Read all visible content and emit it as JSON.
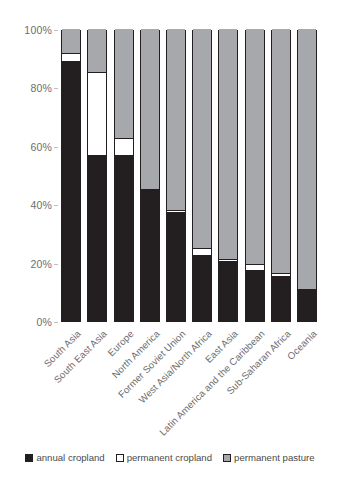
{
  "chart_data": {
    "type": "bar",
    "subtype": "stacked-100-percent",
    "title": "",
    "xlabel": "",
    "ylabel": "",
    "ylim": [
      0,
      100
    ],
    "yticks": [
      "0%",
      "20%",
      "40%",
      "60%",
      "80%",
      "100%"
    ],
    "ytick_values": [
      0,
      20,
      40,
      60,
      80,
      100
    ],
    "grid": false,
    "legend_position": "bottom",
    "categories": [
      "South Asia",
      "South East Asia",
      "Europe",
      "North America",
      "Former Soviet Union",
      "West Asia/North Africa",
      "East Asia",
      "Latin America and the Caribbean",
      "Sub-Saharan Africa",
      "Oceania"
    ],
    "series": [
      {
        "name": "annual cropland",
        "color": "#231f20",
        "values": [
          88.7,
          56.5,
          56.5,
          45.2,
          37.0,
          22.3,
          20.2,
          17.1,
          15.1,
          11.0
        ]
      },
      {
        "name": "permanent cropland",
        "color": "#ffffff",
        "values": [
          3.1,
          28.8,
          6.2,
          0.0,
          1.0,
          2.7,
          1.0,
          2.4,
          1.3,
          0.0
        ]
      },
      {
        "name": "permanent pasture",
        "color": "#a6a8ab",
        "values": [
          8.2,
          14.7,
          37.3,
          54.8,
          62.0,
          75.0,
          78.8,
          80.5,
          83.6,
          89.0
        ]
      }
    ]
  },
  "legend": {
    "items": [
      {
        "label": "annual cropland",
        "swatch": "black-square-swatch"
      },
      {
        "label": "permanent cropland",
        "swatch": "white-square-swatch"
      },
      {
        "label": "permanent pasture",
        "swatch": "gray-square-swatch"
      }
    ]
  },
  "colors": {
    "annual_cropland": "#231f20",
    "permanent_cropland": "#ffffff",
    "permanent_pasture": "#a6a8ab",
    "axis_text": "#6d6e71",
    "background": "#ffffff"
  }
}
